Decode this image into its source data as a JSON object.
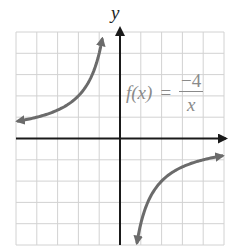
{
  "chart_data": {
    "type": "line",
    "title": "",
    "function_label": {
      "lhs": "f(x)",
      "equals": "=",
      "numerator": "−4",
      "denominator": "x"
    },
    "xlabel": "",
    "ylabel": "y",
    "xlim": [
      -5,
      5
    ],
    "ylim": [
      -5,
      5
    ],
    "grid": true,
    "grid_step": 1,
    "tick_labels": false,
    "series": [
      {
        "name": "f(x) = -4/x, x < 0",
        "x": [
          -4.9,
          -4,
          -3,
          -2,
          -1.5,
          -1.2,
          -1,
          -0.86
        ],
        "values": [
          0.82,
          1,
          1.33,
          2,
          2.67,
          3.33,
          4,
          4.65
        ],
        "color": "#6b6b6b",
        "arrows": "both"
      },
      {
        "name": "f(x) = -4/x, x > 0",
        "x": [
          0.82,
          1,
          1.2,
          1.5,
          2,
          3,
          4,
          4.9
        ],
        "values": [
          -4.88,
          -4,
          -3.33,
          -2.67,
          -2,
          -1.33,
          -1,
          -0.82
        ],
        "color": "#6b6b6b",
        "arrows": "both"
      }
    ]
  },
  "colors": {
    "grid": "#d2d2d2",
    "axis": "#1a1a1a",
    "curve": "#6b6b6b",
    "formula": "#8a8a8a"
  }
}
